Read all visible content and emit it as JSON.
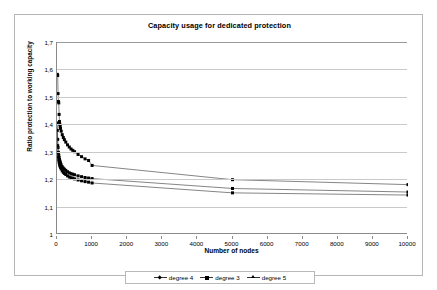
{
  "chart_data": {
    "type": "line",
    "title": "Capacity usage for dedicated protection",
    "xlabel": "Number of nodes",
    "ylabel": "Ratio protection to working capacity",
    "xlim": [
      0,
      10000
    ],
    "ylim": [
      1,
      1.7
    ],
    "xticks": [
      0,
      1000,
      2000,
      3000,
      4000,
      5000,
      6000,
      7000,
      8000,
      9000,
      10000
    ],
    "xtick_labels": [
      "0",
      "1000",
      "2000",
      "3000",
      "4000",
      "5000",
      "6000",
      "7000",
      "8000",
      "9000",
      "10000"
    ],
    "yticks": [
      1,
      1.1,
      1.2,
      1.3,
      1.4,
      1.5,
      1.6,
      1.7
    ],
    "ytick_labels": [
      "1",
      "1,1",
      "1,2",
      "1,3",
      "1,4",
      "1,5",
      "1,6",
      "1,7"
    ],
    "grid": "horizontal",
    "legend_position": "bottom",
    "marker": "square",
    "line_color": "#333333",
    "marker_color": "#000000",
    "grid_color": "#c9c9c9",
    "series": [
      {
        "name": "degree 4",
        "x": [
          10,
          20,
          30,
          40,
          50,
          60,
          70,
          80,
          90,
          100,
          120,
          150,
          180,
          210,
          250,
          300,
          350,
          400,
          450,
          500,
          600,
          700,
          800,
          900,
          1000,
          5000,
          10000
        ],
        "y": [
          1.405,
          1.345,
          1.315,
          1.298,
          1.287,
          1.279,
          1.272,
          1.266,
          1.262,
          1.258,
          1.252,
          1.245,
          1.24,
          1.236,
          1.232,
          1.227,
          1.223,
          1.22,
          1.218,
          1.216,
          1.212,
          1.209,
          1.206,
          1.204,
          1.202,
          1.166,
          1.153
        ]
      },
      {
        "name": "degree 3",
        "x": [
          10,
          20,
          30,
          40,
          50,
          60,
          70,
          80,
          90,
          100,
          120,
          150,
          180,
          210,
          250,
          300,
          350,
          400,
          450,
          500,
          600,
          700,
          800,
          900,
          1000,
          5000,
          10000
        ],
        "y": [
          1.582,
          1.578,
          1.512,
          1.483,
          1.478,
          1.436,
          1.41,
          1.4,
          1.392,
          1.385,
          1.375,
          1.362,
          1.352,
          1.344,
          1.335,
          1.325,
          1.317,
          1.31,
          1.305,
          1.3,
          1.29,
          1.282,
          1.274,
          1.268,
          1.25,
          1.198,
          1.18
        ]
      },
      {
        "name": "degree 5",
        "x": [
          10,
          20,
          30,
          40,
          50,
          60,
          70,
          80,
          90,
          100,
          120,
          150,
          180,
          210,
          250,
          300,
          350,
          400,
          450,
          500,
          600,
          700,
          800,
          900,
          1000,
          5000,
          10000
        ],
        "y": [
          1.378,
          1.322,
          1.295,
          1.28,
          1.27,
          1.262,
          1.256,
          1.251,
          1.247,
          1.243,
          1.237,
          1.23,
          1.225,
          1.221,
          1.217,
          1.212,
          1.208,
          1.205,
          1.203,
          1.201,
          1.197,
          1.194,
          1.191,
          1.189,
          1.186,
          1.15,
          1.142
        ]
      }
    ],
    "legend": [
      {
        "label": "degree 4",
        "marker": "diamond"
      },
      {
        "label": "degree 3",
        "marker": "square"
      },
      {
        "label": "degree 5",
        "marker": "triangle"
      }
    ]
  }
}
